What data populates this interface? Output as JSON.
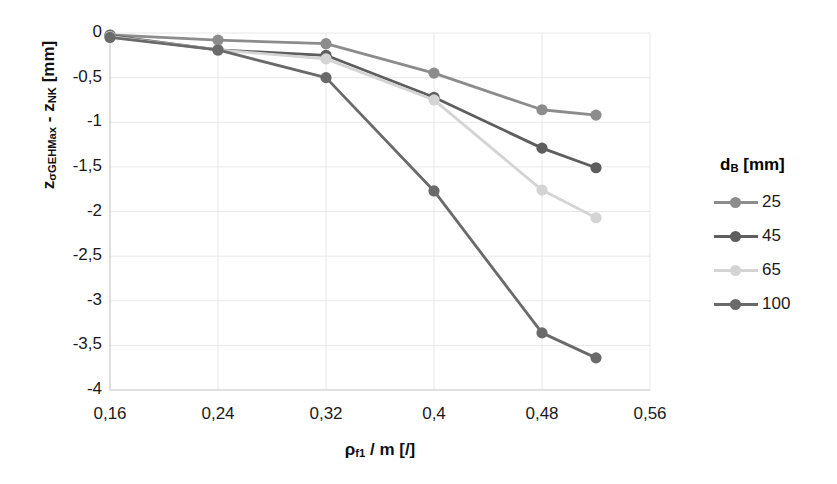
{
  "chart_data": {
    "type": "line",
    "title": "",
    "subtitle": "",
    "xlabel": "ρf1 / m [/]",
    "ylabel": "zσGEHMax - zNK [mm]",
    "xlim": [
      0.16,
      0.56
    ],
    "ylim": [
      -4,
      0
    ],
    "xticks": [
      "0,16",
      "0,24",
      "0,32",
      "0,4",
      "0,48",
      "0,56"
    ],
    "xtick_values": [
      0.16,
      0.24,
      0.32,
      0.4,
      0.48,
      0.56
    ],
    "yticks": [
      "0",
      "-0,5",
      "-1",
      "-1,5",
      "-2",
      "-2,5",
      "-3",
      "-3,5",
      "-4"
    ],
    "ytick_values": [
      0,
      -0.5,
      -1,
      -1.5,
      -2,
      -2.5,
      -3,
      -3.5,
      -4
    ],
    "grid": true,
    "legend_position": "right",
    "legend_title": "dB [mm]",
    "series": [
      {
        "name": "25",
        "color": "#8c8c8c",
        "x": [
          0.16,
          0.24,
          0.32,
          0.4,
          0.48,
          0.52
        ],
        "values": [
          -0.02,
          -0.08,
          -0.12,
          -0.45,
          -0.86,
          -0.92
        ]
      },
      {
        "name": "45",
        "color": "#5e5e5e",
        "x": [
          0.16,
          0.24,
          0.32,
          0.4,
          0.48,
          0.52
        ],
        "values": [
          -0.03,
          -0.19,
          -0.25,
          -0.72,
          -1.29,
          -1.51
        ]
      },
      {
        "name": "65",
        "color": "#d4d4d4",
        "x": [
          0.16,
          0.24,
          0.32,
          0.4,
          0.48,
          0.52
        ],
        "values": [
          -0.04,
          -0.19,
          -0.29,
          -0.75,
          -1.76,
          -2.07
        ]
      },
      {
        "name": "100",
        "color": "#6a6a6a",
        "x": [
          0.16,
          0.24,
          0.32,
          0.4,
          0.48,
          0.52
        ],
        "values": [
          -0.05,
          -0.19,
          -0.5,
          -1.77,
          -3.36,
          -3.64
        ]
      }
    ]
  },
  "axes": {
    "ylabel_prefix": "z",
    "ylabel_sub1": "σGEHMax",
    "ylabel_mid": " - z",
    "ylabel_sub2": "NK",
    "ylabel_suffix": " [mm]",
    "xlabel_prefix": "ρ",
    "xlabel_sub": "f1",
    "xlabel_suffix": " / m [/]"
  },
  "legend": {
    "title_prefix": "d",
    "title_sub": "B",
    "title_suffix": " [mm]",
    "items": [
      {
        "label": "25",
        "color": "#8c8c8c"
      },
      {
        "label": "45",
        "color": "#5e5e5e"
      },
      {
        "label": "65",
        "color": "#d4d4d4"
      },
      {
        "label": "100",
        "color": "#6a6a6a"
      }
    ]
  }
}
